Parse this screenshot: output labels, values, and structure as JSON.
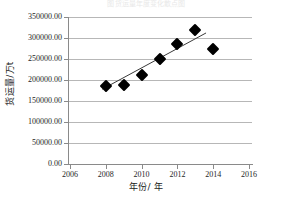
{
  "figure": {
    "cutoff_title": "图 货运量年度变化散点图"
  },
  "chart_data": {
    "type": "scatter",
    "title": "",
    "xlabel": "年份/ 年",
    "ylabel": "货运量/万t",
    "xlim": [
      2006,
      2016
    ],
    "ylim": [
      0,
      350000
    ],
    "xticks": [
      "2006",
      "2008",
      "2010",
      "2012",
      "2014",
      "2016"
    ],
    "xtick_values": [
      2006,
      2008,
      2010,
      2012,
      2014,
      2016
    ],
    "yticks": [
      "0.00",
      "50000.00",
      "100000.00",
      "150000.00",
      "200000.00",
      "250000.00",
      "300000.00",
      "350000.00"
    ],
    "ytick_values": [
      0,
      50000,
      100000,
      150000,
      200000,
      250000,
      300000,
      350000
    ],
    "grid": "horizontal",
    "legend": "none",
    "marker": "diamond",
    "marker_color": "#000000",
    "series": [
      {
        "name": "货运量",
        "x": [
          2008,
          2009,
          2010,
          2011,
          2012,
          2013,
          2014
        ],
        "values": [
          185000,
          187000,
          213000,
          251000,
          285000,
          318000,
          275000
        ]
      }
    ],
    "trendline": {
      "type": "linear",
      "x_start": 2007.8,
      "y_start": 178000,
      "x_end": 2013.6,
      "y_end": 312000,
      "color": "#3a3a3a"
    }
  }
}
